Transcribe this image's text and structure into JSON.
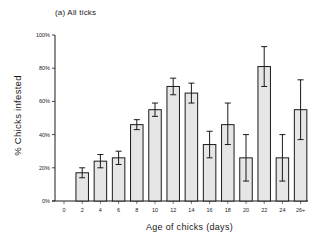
{
  "chart_data": {
    "type": "bar",
    "title": "(a)  All ticks",
    "xlabel": "Age of chicks (days)",
    "ylabel": "% Chicks infested",
    "categories": [
      "0",
      "2",
      "4",
      "6",
      "8",
      "10",
      "12",
      "14",
      "16",
      "18",
      "20",
      "22",
      "24",
      "26+"
    ],
    "values": [
      0,
      17,
      24,
      26,
      46,
      55,
      69,
      65,
      34,
      46,
      26,
      81,
      26,
      55
    ],
    "error_low": [
      0,
      14,
      20,
      22,
      43,
      51,
      64,
      59,
      26,
      34,
      12,
      69,
      12,
      37
    ],
    "error_high": [
      0,
      20,
      28,
      30,
      49,
      59,
      74,
      71,
      42,
      59,
      40,
      93,
      40,
      73
    ],
    "ylim": [
      0,
      100
    ],
    "yticks": [
      "0%",
      "20%",
      "40%",
      "60%",
      "80%",
      "100%"
    ],
    "grid": false,
    "legend": null,
    "bar_fill": "#e6e6e6",
    "bar_edge": "#1a1a1a"
  }
}
